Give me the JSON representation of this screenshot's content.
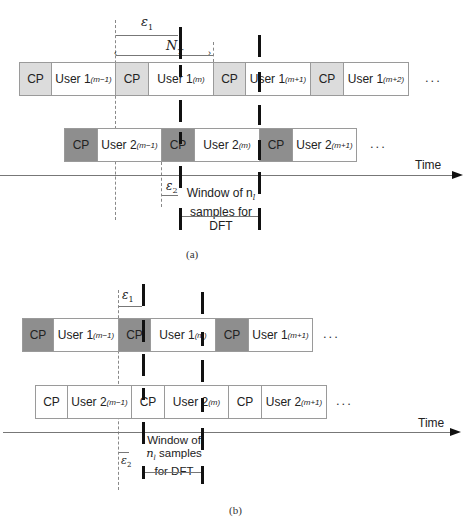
{
  "panel_a": {
    "caption": "(a)",
    "epsilon1": "ε",
    "epsilon1_sub": "1",
    "nt": "N",
    "nt_sub": "T",
    "epsilon2": "ε",
    "epsilon2_sub": "2",
    "window_line1": "Window of n",
    "window_line1_sub": "l",
    "window_line2": "samples for",
    "window_line3": "DFT",
    "time_label": "Time",
    "ellipsis_row1": "...",
    "ellipsis_row2": "...",
    "row1": [
      {
        "type": "cp",
        "label": "CP"
      },
      {
        "type": "user",
        "label": "User 1",
        "sub": "(m−1)"
      },
      {
        "type": "cp",
        "label": "CP"
      },
      {
        "type": "user",
        "label": "User 1",
        "sub": "(m)"
      },
      {
        "type": "cp",
        "label": "CP"
      },
      {
        "type": "user",
        "label": "User 1",
        "sub": "(m+1)"
      },
      {
        "type": "cp",
        "label": "CP"
      },
      {
        "type": "user",
        "label": "User 1",
        "sub": "(m+2)"
      }
    ],
    "row2": [
      {
        "type": "cp",
        "label": "CP"
      },
      {
        "type": "user",
        "label": "User 2",
        "sub": "(m−1)"
      },
      {
        "type": "cp",
        "label": "CP"
      },
      {
        "type": "user",
        "label": "User 2",
        "sub": "(m)"
      },
      {
        "type": "cp",
        "label": "CP"
      },
      {
        "type": "user",
        "label": "User 2",
        "sub": "(m+1)"
      }
    ]
  },
  "panel_b": {
    "caption": "(b)",
    "epsilon1": "ε",
    "epsilon1_sub": "1",
    "epsilon2": "ε",
    "epsilon2_sub": "2",
    "window_line1": "Window of",
    "window_line2": "n",
    "window_line2_sub": "l",
    "window_line2_rest": " samples",
    "window_line3": "for DFT",
    "time_label": "Time",
    "ellipsis_row1": "...",
    "ellipsis_row2": "...",
    "row1": [
      {
        "type": "cp",
        "label": "CP"
      },
      {
        "type": "user",
        "label": "User 1",
        "sub": "(m−1)"
      },
      {
        "type": "cp",
        "label": "CP"
      },
      {
        "type": "user",
        "label": "User 1",
        "sub": "(m)"
      },
      {
        "type": "cp",
        "label": "CP"
      },
      {
        "type": "user",
        "label": "User 1",
        "sub": "(m+1)"
      }
    ],
    "row2": [
      {
        "type": "cp",
        "label": "CP"
      },
      {
        "type": "user",
        "label": "User 2",
        "sub": "(m−1)"
      },
      {
        "type": "cp",
        "label": "CP"
      },
      {
        "type": "user",
        "label": "User 2",
        "sub": "(m)"
      },
      {
        "type": "cp",
        "label": "CP"
      },
      {
        "type": "user",
        "label": "User 2",
        "sub": "(m+1)"
      }
    ]
  }
}
